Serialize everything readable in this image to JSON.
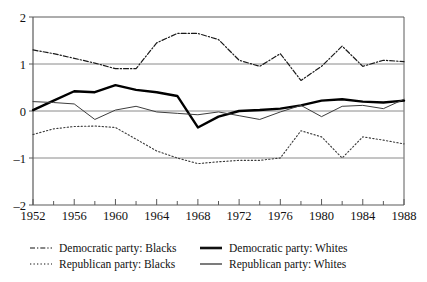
{
  "chart_data": {
    "type": "line",
    "title": "",
    "xlabel": "",
    "ylabel": "",
    "xlim": [
      1952,
      1988
    ],
    "ylim": [
      -2,
      2
    ],
    "grid": true,
    "gridlines_y": [
      1,
      0,
      -1
    ],
    "legend_position": "bottom",
    "x_ticks_major": [
      1952,
      1956,
      1960,
      1964,
      1968,
      1972,
      1976,
      1980,
      1984,
      1988
    ],
    "x_ticks_minor": [
      1954,
      1958,
      1962,
      1966,
      1970,
      1974,
      1978,
      1982,
      1986
    ],
    "y_ticks": [
      2,
      1,
      0,
      -1,
      -2
    ],
    "y_tick_labels": [
      "2",
      "1",
      "0",
      "–1",
      "–2"
    ],
    "x": [
      1952,
      1954,
      1956,
      1958,
      1960,
      1962,
      1964,
      1966,
      1968,
      1970,
      1972,
      1974,
      1976,
      1978,
      1980,
      1982,
      1984,
      1986,
      1988
    ],
    "series": [
      {
        "name": "Democratic party: Blacks",
        "style": "dash-dot",
        "color": "#1a1a1a",
        "width": 1.2,
        "values": [
          1.3,
          1.22,
          1.12,
          1.02,
          0.9,
          0.9,
          1.45,
          1.65,
          1.65,
          1.52,
          1.08,
          0.95,
          1.22,
          0.65,
          0.95,
          1.38,
          0.95,
          1.08,
          1.05
        ]
      },
      {
        "name": "Republican party: Blacks",
        "style": "dotted",
        "color": "#3a3a3a",
        "width": 1.1,
        "values": [
          -0.5,
          -0.38,
          -0.33,
          -0.32,
          -0.35,
          -0.6,
          -0.85,
          -1.0,
          -1.12,
          -1.08,
          -1.05,
          -1.05,
          -1.0,
          -0.42,
          -0.55,
          -1.0,
          -0.55,
          -0.62,
          -0.7
        ]
      },
      {
        "name": "Democratic party: Whites",
        "style": "solid-thick",
        "color": "#000000",
        "width": 2.4,
        "values": [
          0.02,
          0.22,
          0.42,
          0.4,
          0.55,
          0.45,
          0.4,
          0.32,
          -0.35,
          -0.12,
          0.0,
          0.02,
          0.05,
          0.12,
          0.22,
          0.25,
          0.2,
          0.18,
          0.22
        ]
      },
      {
        "name": "Republican party: Whites",
        "style": "solid-thin",
        "color": "#3d3d3d",
        "width": 1.0,
        "values": [
          0.2,
          0.18,
          0.15,
          -0.18,
          0.02,
          0.1,
          -0.02,
          -0.05,
          -0.08,
          -0.02,
          -0.1,
          -0.18,
          -0.02,
          0.12,
          -0.12,
          0.1,
          0.12,
          0.05,
          0.25
        ]
      }
    ]
  },
  "legend": {
    "items": [
      {
        "label": "Democratic party:  Blacks",
        "style": "dash-dot"
      },
      {
        "label": "Democratic party:  Whites",
        "style": "solid-thick"
      },
      {
        "label": "Republican party: Blacks",
        "style": "dotted"
      },
      {
        "label": "Republican party:  Whites",
        "style": "solid-thin"
      }
    ]
  },
  "colors": {
    "axis": "#5a5a5a",
    "grid": "#8a8a8a",
    "text": "#111111",
    "background": "#ffffff"
  }
}
